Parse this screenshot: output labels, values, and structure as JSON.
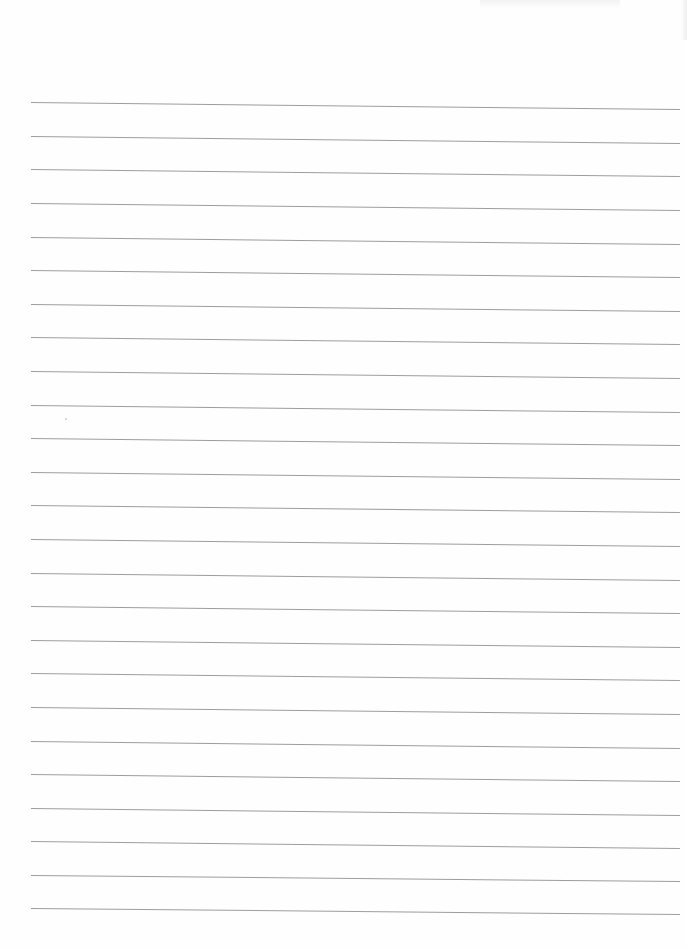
{
  "page": {
    "type": "blank lined paper",
    "background_color": "#fefefe",
    "line_color": "#8c8c8c",
    "line_count": 25,
    "lines": [
      {
        "y_left": 102,
        "y_right": 109
      },
      {
        "y_left": 136,
        "y_right": 143
      },
      {
        "y_left": 169,
        "y_right": 176
      },
      {
        "y_left": 203,
        "y_right": 210
      },
      {
        "y_left": 237,
        "y_right": 244
      },
      {
        "y_left": 270,
        "y_right": 277
      },
      {
        "y_left": 304,
        "y_right": 311
      },
      {
        "y_left": 337,
        "y_right": 344
      },
      {
        "y_left": 371,
        "y_right": 378
      },
      {
        "y_left": 405,
        "y_right": 412
      },
      {
        "y_left": 438,
        "y_right": 445
      },
      {
        "y_left": 472,
        "y_right": 479
      },
      {
        "y_left": 505,
        "y_right": 512
      },
      {
        "y_left": 539,
        "y_right": 546
      },
      {
        "y_left": 573,
        "y_right": 580
      },
      {
        "y_left": 606,
        "y_right": 613
      },
      {
        "y_left": 640,
        "y_right": 647
      },
      {
        "y_left": 673,
        "y_right": 680
      },
      {
        "y_left": 707,
        "y_right": 714
      },
      {
        "y_left": 741,
        "y_right": 748
      },
      {
        "y_left": 774,
        "y_right": 781
      },
      {
        "y_left": 808,
        "y_right": 815
      },
      {
        "y_left": 841,
        "y_right": 848
      },
      {
        "y_left": 875,
        "y_right": 881
      },
      {
        "y_left": 908,
        "y_right": 914
      }
    ],
    "line_x_start": 31,
    "line_x_end": 680
  }
}
